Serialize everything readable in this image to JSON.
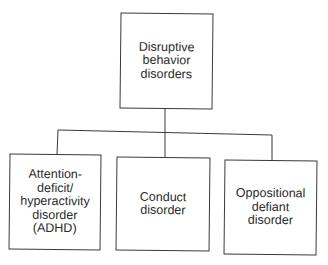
{
  "diagram": {
    "type": "hierarchy",
    "root": {
      "label": "Disruptive\nbehavior\ndisorders"
    },
    "children": [
      {
        "label": "Attention-\ndeficit/\nhyperactivity\ndisorder\n(ADHD)"
      },
      {
        "label": "Conduct\ndisorder"
      },
      {
        "label": "Oppositional\ndefiant\ndisorder"
      }
    ]
  }
}
